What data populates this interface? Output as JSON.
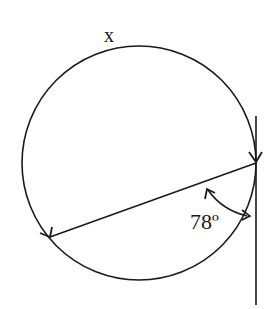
{
  "diagram": {
    "arc_label": "x",
    "angle_label": "78º",
    "angle_degrees": 78,
    "elements": [
      "circle",
      "tangent-line",
      "chord",
      "angle-arc"
    ],
    "stroke_color": "#1a1a1a",
    "background": "#ffffff"
  }
}
